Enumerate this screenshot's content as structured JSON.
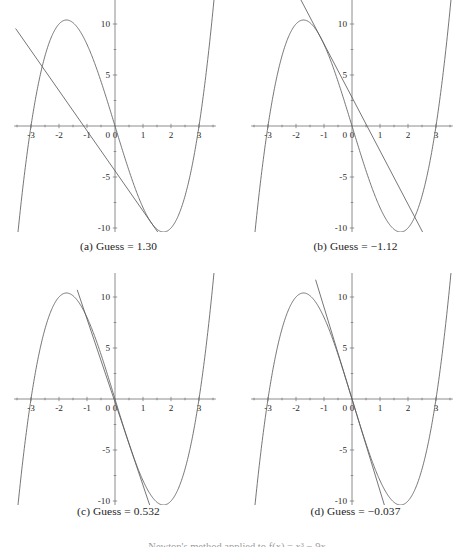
{
  "figure": {
    "title_partial": "Newton's method applied to f(x) = x³ − 9x",
    "panel_count": 4
  },
  "chart_data": [
    {
      "type": "line",
      "id": "panel-a",
      "caption": "(a) Guess = 1.30",
      "guess_label": "Guess",
      "guess_value": "1.30",
      "guess": 1.3,
      "title": "",
      "xlabel": "",
      "ylabel": "",
      "xlim": [
        -3.6,
        3.6
      ],
      "ylim": [
        -13.5,
        12.5
      ],
      "grid": false,
      "legend": "none",
      "xticks": [
        -3,
        -2,
        -1,
        0,
        1,
        2,
        3
      ],
      "xticklabels": [
        "-3",
        "-2",
        "-1",
        "0",
        "1",
        "2",
        "3"
      ],
      "yticks": [
        -10,
        -5,
        5,
        10
      ],
      "yticklabels": [
        "-10",
        "-5",
        "5",
        "10"
      ],
      "series": [
        {
          "name": "f(x) = x^3 - 9x",
          "kind": "cubic",
          "coefficients": {
            "a": 1,
            "b": 0,
            "c": -9,
            "d": 0
          },
          "roots": [
            -3,
            0,
            3
          ],
          "local_max": {
            "x": -1.732,
            "y": 10.39
          },
          "local_min": {
            "x": 1.732,
            "y": -10.39
          }
        },
        {
          "name": "tangent at x = 1.30",
          "kind": "line",
          "point": {
            "x": 1.3,
            "y": -9.503
          },
          "slope": -3.93,
          "x_intercept": -1.118,
          "x_start": -3.55,
          "x_end": 2.6
        }
      ]
    },
    {
      "type": "line",
      "id": "panel-b",
      "caption": "(b) Guess = −1.12",
      "guess_label": "Guess",
      "guess_value": "−1.12",
      "guess": -1.12,
      "title": "",
      "xlabel": "",
      "ylabel": "",
      "xlim": [
        -3.6,
        3.6
      ],
      "ylim": [
        -13.5,
        12.5
      ],
      "grid": false,
      "legend": "none",
      "xticks": [
        -3,
        -2,
        -1,
        0,
        1,
        2,
        3
      ],
      "xticklabels": [
        "-3",
        "-2",
        "-1",
        "0",
        "1",
        "2",
        "3"
      ],
      "yticks": [
        -10,
        -5,
        5,
        10
      ],
      "yticklabels": [
        "-10",
        "-5",
        "5",
        "10"
      ],
      "series": [
        {
          "name": "f(x) = x^3 - 9x",
          "kind": "cubic",
          "coefficients": {
            "a": 1,
            "b": 0,
            "c": -9,
            "d": 0
          },
          "roots": [
            -3,
            0,
            3
          ],
          "local_max": {
            "x": -1.732,
            "y": 10.39
          },
          "local_min": {
            "x": 1.732,
            "y": -10.39
          }
        },
        {
          "name": "tangent at x = -1.12",
          "kind": "line",
          "point": {
            "x": -1.12,
            "y": 8.675
          },
          "slope": -5.237,
          "x_intercept": 0.536,
          "x_start": -1.85,
          "x_end": 2.95
        }
      ]
    },
    {
      "type": "line",
      "id": "panel-c",
      "caption": "(c) Guess = 0.532",
      "guess_label": "Guess",
      "guess_value": "0.532",
      "guess": 0.532,
      "title": "",
      "xlabel": "",
      "ylabel": "",
      "xlim": [
        -3.6,
        3.6
      ],
      "ylim": [
        -13.5,
        12.5
      ],
      "grid": false,
      "legend": "none",
      "xticks": [
        -3,
        -2,
        -1,
        0,
        1,
        2,
        3
      ],
      "xticklabels": [
        "-3",
        "-2",
        "-1",
        "0",
        "1",
        "2",
        "3"
      ],
      "yticks": [
        -10,
        -5,
        5,
        10
      ],
      "yticklabels": [
        "-10",
        "-5",
        "5",
        "10"
      ],
      "series": [
        {
          "name": "f(x) = x^3 - 9x",
          "kind": "cubic",
          "coefficients": {
            "a": 1,
            "b": 0,
            "c": -9,
            "d": 0
          },
          "roots": [
            -3,
            0,
            3
          ],
          "local_max": {
            "x": -1.732,
            "y": 10.39
          },
          "local_min": {
            "x": 1.732,
            "y": -10.39
          }
        },
        {
          "name": "tangent at x = 0.532",
          "kind": "line",
          "point": {
            "x": 0.532,
            "y": -4.638
          },
          "slope": -8.151,
          "x_intercept": -0.037,
          "x_start": -1.35,
          "x_end": 1.65
        }
      ]
    },
    {
      "type": "line",
      "id": "panel-d",
      "caption": "(d) Guess = −0.037",
      "guess_label": "Guess",
      "guess_value": "−0.037",
      "guess": -0.037,
      "title": "",
      "xlabel": "",
      "ylabel": "",
      "xlim": [
        -3.6,
        3.6
      ],
      "ylim": [
        -13.5,
        12.5
      ],
      "grid": false,
      "legend": "none",
      "xticks": [
        -3,
        -2,
        -1,
        0,
        1,
        2,
        3
      ],
      "xticklabels": [
        "-3",
        "-2",
        "-1",
        "0",
        "1",
        "2",
        "3"
      ],
      "yticks": [
        -10,
        -5,
        5,
        10
      ],
      "yticklabels": [
        "-10",
        "-5",
        "5",
        "10"
      ],
      "series": [
        {
          "name": "f(x) = x^3 - 9x",
          "kind": "cubic",
          "coefficients": {
            "a": 1,
            "b": 0,
            "c": -9,
            "d": 0
          },
          "roots": [
            -3,
            0,
            3
          ],
          "local_max": {
            "x": -1.732,
            "y": 10.39
          },
          "local_min": {
            "x": 1.732,
            "y": -10.39
          }
        },
        {
          "name": "tangent at x = -0.037",
          "kind": "line",
          "point": {
            "x": -0.037,
            "y": 0.333
          },
          "slope": -8.996,
          "x_intercept": 0.0,
          "x_start": -1.3,
          "x_end": 1.3
        }
      ]
    }
  ],
  "colors": {
    "curve": "#5d5d5d",
    "axis": "#6f6f6f",
    "text": "#1c1c1c",
    "background": "#ffffff"
  }
}
